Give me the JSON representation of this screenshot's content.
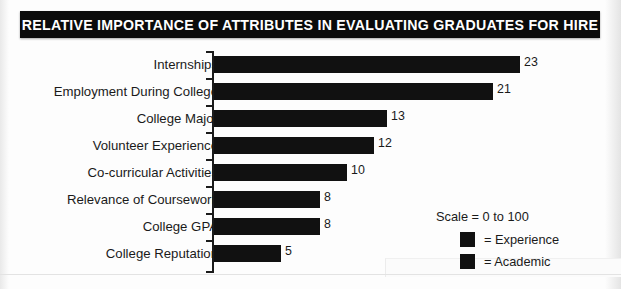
{
  "title": "RELATIVE IMPORTANCE OF ATTRIBUTES IN EVALUATING GRADUATES FOR HIRE",
  "legend": {
    "scale_note": "Scale = 0 to 100",
    "entries": [
      {
        "label": "= Experience",
        "color": "#111111",
        "swatch_name": "legend-swatch-experience"
      },
      {
        "label": "= Academic",
        "color": "#111111",
        "swatch_name": "legend-swatch-academic"
      }
    ]
  },
  "chart_data": {
    "type": "bar",
    "orientation": "horizontal",
    "title": "RELATIVE IMPORTANCE OF ATTRIBUTES IN EVALUATING GRADUATES FOR HIRE",
    "xlabel": "",
    "ylabel": "",
    "xlim": [
      0,
      100
    ],
    "grid": false,
    "legend_position": "right",
    "scale_note": "Scale = 0 to 100",
    "bar_color": "#111111",
    "categories": [
      "Internships",
      "Employment During College",
      "College Major",
      "Volunteer Experience",
      "Co-curricular Activities",
      "Relevance of Coursework",
      "College GPA",
      "College Reputation"
    ],
    "values": [
      23,
      21,
      13,
      12,
      10,
      8,
      8,
      5
    ],
    "value_labels": [
      "23",
      "21",
      "13",
      "12",
      "10",
      "8",
      "8",
      "5"
    ],
    "series": [
      {
        "name": "Relative importance",
        "values": [
          23,
          21,
          13,
          12,
          10,
          8,
          8,
          5
        ]
      }
    ],
    "category_groups": [
      "Experience",
      "Experience",
      "Academic",
      "Experience",
      "Experience",
      "Academic",
      "Academic",
      "Academic"
    ]
  }
}
